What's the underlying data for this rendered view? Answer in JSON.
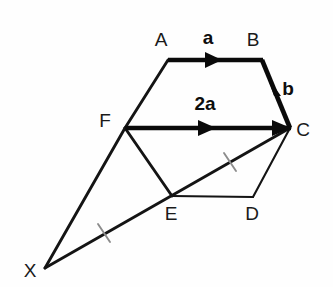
{
  "figure": {
    "width": 333,
    "height": 287,
    "background_color": "#fefefe",
    "ink_color": "#141414",
    "tick_color": "#8c8c8c"
  },
  "vertices": [
    {
      "id": "A",
      "label": "A",
      "x": 168,
      "y": 60,
      "label_x": 161,
      "label_y": 46
    },
    {
      "id": "B",
      "label": "B",
      "x": 262,
      "y": 60,
      "label_x": 253,
      "label_y": 46
    },
    {
      "id": "C",
      "label": "C",
      "x": 290,
      "y": 128,
      "label_x": 303,
      "label_y": 136
    },
    {
      "id": "D",
      "label": "D",
      "x": 253,
      "y": 197,
      "label_x": 252,
      "label_y": 220
    },
    {
      "id": "E",
      "label": "E",
      "x": 172,
      "y": 196,
      "label_x": 171,
      "label_y": 220
    },
    {
      "id": "F",
      "label": "F",
      "x": 125,
      "y": 128,
      "label_x": 105,
      "label_y": 127
    },
    {
      "id": "X",
      "label": "X",
      "x": 45,
      "y": 268,
      "label_x": 30,
      "label_y": 277
    }
  ],
  "edges": [
    {
      "name": "edge-A-B",
      "from": "A",
      "to": "B",
      "weight": "bold",
      "has_arrow": true,
      "vector_label": "a"
    },
    {
      "name": "edge-B-C",
      "from": "B",
      "to": "C",
      "weight": "bold",
      "has_arrow": true,
      "vector_label": "b"
    },
    {
      "name": "edge-F-C",
      "from": "F",
      "to": "C",
      "weight": "bold",
      "has_arrow": true,
      "vector_label": "2a"
    },
    {
      "name": "edge-A-F",
      "from": "A",
      "to": "F",
      "weight": "medium",
      "has_arrow": false,
      "vector_label": ""
    },
    {
      "name": "edge-F-E",
      "from": "F",
      "to": "E",
      "weight": "medium",
      "has_arrow": false,
      "vector_label": ""
    },
    {
      "name": "edge-E-D",
      "from": "E",
      "to": "D",
      "weight": "thin",
      "has_arrow": false,
      "vector_label": ""
    },
    {
      "name": "edge-D-C",
      "from": "D",
      "to": "C",
      "weight": "thin",
      "has_arrow": false,
      "vector_label": ""
    },
    {
      "name": "edge-X-F",
      "from": "X",
      "to": "F",
      "weight": "medium",
      "has_arrow": false,
      "vector_label": ""
    },
    {
      "name": "edge-X-C",
      "from": "X",
      "to": "C",
      "weight": "medium",
      "has_arrow": false,
      "vector_label": ""
    }
  ],
  "vector_labels": [
    {
      "id": "vec-a",
      "text": "a",
      "x": 208,
      "y": 44,
      "describes": "edge-A-B"
    },
    {
      "id": "vec-b",
      "text": "b",
      "x": 288,
      "y": 95,
      "describes": "edge-B-C"
    },
    {
      "id": "vec-2a",
      "text": "2a",
      "x": 205,
      "y": 110,
      "describes": "edge-F-C"
    }
  ],
  "tick_marks": [
    {
      "id": "tick-XE",
      "on_segment": "X-E",
      "center_x": 104,
      "center_y": 233,
      "describes": "equal length marker"
    },
    {
      "id": "tick-EC",
      "on_segment": "E-C",
      "center_x": 230,
      "center_y": 162,
      "describes": "equal length marker"
    }
  ]
}
